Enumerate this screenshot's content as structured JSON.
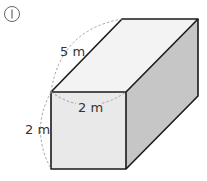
{
  "problem_number": "1",
  "shape": "rectangular prism",
  "labels": {
    "length": "5 m",
    "width": "2 m",
    "height": "2 m"
  },
  "colors": {
    "edge": "#1a1a1a",
    "dashed": "#9a9a9a",
    "front_face": "#e8e8e8",
    "top_face": "#f2f2f2",
    "right_face": "#c4c4c4"
  }
}
